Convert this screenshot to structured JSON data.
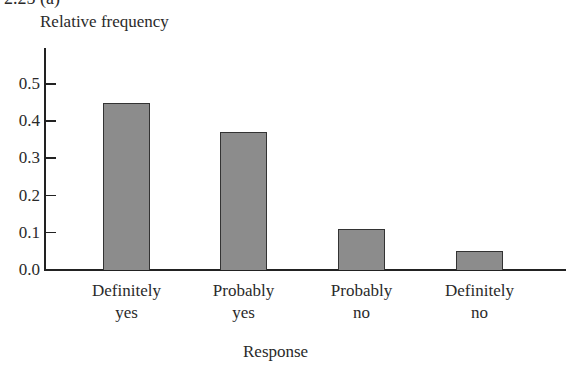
{
  "figure_label": "2.25  (a)",
  "chart_data": {
    "type": "bar",
    "title": "",
    "xlabel": "Response",
    "ylabel": "Relative frequency",
    "categories": [
      "Definitely yes",
      "Probably yes",
      "Probably no",
      "Definitely no"
    ],
    "category_lines": [
      [
        "Definitely",
        "yes"
      ],
      [
        "Probably",
        "yes"
      ],
      [
        "Probably",
        "no"
      ],
      [
        "Definitely",
        "no"
      ]
    ],
    "values": [
      0.45,
      0.37,
      0.11,
      0.05
    ],
    "ylim": [
      0.0,
      0.55
    ],
    "yticks": [
      "0.0",
      "0.1",
      "0.2",
      "0.3",
      "0.4",
      "0.5"
    ],
    "grid": false,
    "legend": null,
    "bar_color": "#8c8c8c",
    "bar_edge_color": "#333333"
  }
}
